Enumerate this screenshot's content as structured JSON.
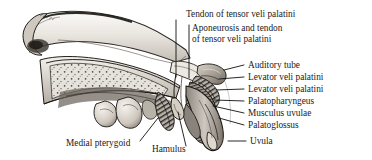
{
  "figure": {
    "kind": "anatomical-illustration",
    "style": "grayscale pen-and-ink / halftone medical drawing",
    "background_color": "#ffffff",
    "ink_color": "#1a1a1a"
  },
  "labels": [
    {
      "id": "tendon-of-tensor-veli-palatini",
      "lines": [
        "Tendon of tensor veli palatini"
      ],
      "x": 186,
      "y": 17,
      "anchor": "start",
      "leader": "M176,20 L176,77"
    },
    {
      "id": "aponeurosis-and-tendon-of-tensor-veli-palatini",
      "lines": [
        "Aponeurosis and tendon",
        "of tensor veli palatini"
      ],
      "x": 192,
      "y": 31,
      "anchor": "start",
      "leader": "M189,25 L189,78"
    },
    {
      "id": "auditory-tube",
      "lines": [
        "Auditory tube"
      ],
      "x": 248,
      "y": 68,
      "anchor": "start",
      "leader": "M244,65 L224,70"
    },
    {
      "id": "levator-veli-palatini-upper",
      "lines": [
        "Levator veli palatini"
      ],
      "x": 248,
      "y": 80,
      "anchor": "start",
      "leader": "M244,77 L219,79"
    },
    {
      "id": "levator-veli-palatini-lower",
      "lines": [
        "Levator veli palatini"
      ],
      "x": 248,
      "y": 92,
      "anchor": "start",
      "leader": "M244,89 L216,90"
    },
    {
      "id": "palatopharyngeus",
      "lines": [
        "Palatopharyngeus"
      ],
      "x": 248,
      "y": 104,
      "anchor": "start",
      "leader": "M244,101 L214,100"
    },
    {
      "id": "musculus-uvulae",
      "lines": [
        "Musculus uvulae"
      ],
      "x": 248,
      "y": 116,
      "anchor": "start",
      "leader": "M244,113 L213,106"
    },
    {
      "id": "palatoglossus",
      "lines": [
        "Palatoglossus"
      ],
      "x": 248,
      "y": 128,
      "anchor": "start",
      "leader": "M244,125 L219,118"
    },
    {
      "id": "uvula",
      "lines": [
        "Uvula"
      ],
      "x": 250,
      "y": 144,
      "anchor": "start",
      "leader": "M246,141 L228,141"
    },
    {
      "id": "medial-pterygoid",
      "lines": [
        "Medial pterygoid"
      ],
      "x": 66,
      "y": 146,
      "anchor": "start",
      "leader": "M140,141 L158,118"
    },
    {
      "id": "hamulus",
      "lines": [
        "Hamulus"
      ],
      "x": 152,
      "y": 152,
      "anchor": "start",
      "leader": "M186,146 L178,112"
    }
  ]
}
